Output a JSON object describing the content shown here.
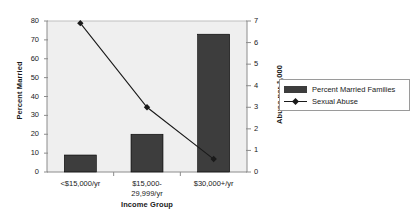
{
  "chart_data": {
    "type": "bar",
    "title": "",
    "subtitle": "",
    "xlabel": "Income Group",
    "ylabel": "Percent Married",
    "y2label": "Abuse per 1,000",
    "categories": [
      "<$15,000/yr",
      "$15,000-29,999/yr",
      "$30,000+/yr"
    ],
    "category_lines": [
      [
        "<$15,000/yr"
      ],
      [
        "$15,000-",
        "29,999/yr"
      ],
      [
        "$30,000+/yr"
      ]
    ],
    "ylim": [
      0,
      80
    ],
    "y2lim": [
      0,
      7
    ],
    "yticks": [
      0,
      10,
      20,
      30,
      40,
      50,
      60,
      70,
      80
    ],
    "y2ticks": [
      0,
      1,
      2,
      3,
      4,
      5,
      6,
      7
    ],
    "ytick_labels": [
      "0",
      "10",
      "20",
      "30",
      "40",
      "50",
      "60",
      "70",
      "80"
    ],
    "y2tick_labels": [
      "0",
      "1",
      "2",
      "3",
      "4",
      "5",
      "6",
      "7"
    ],
    "grid": false,
    "legend_position": "right",
    "series": [
      {
        "name": "Percent Married Families",
        "type": "bar",
        "axis": "left",
        "values": [
          9,
          20,
          73
        ],
        "color": "#3d3d3d"
      },
      {
        "name": "Sexual Abuse",
        "type": "line",
        "axis": "right",
        "values": [
          6.9,
          3.0,
          0.6
        ],
        "color": "#1a1a1a",
        "marker": "diamond"
      }
    ]
  },
  "legend": {
    "entries": [
      {
        "label": "Percent Married Families",
        "swatch": "bar-swatch"
      },
      {
        "label": "Sexual Abuse",
        "swatch": "line-marker-swatch"
      }
    ]
  },
  "axes": {
    "left_title": "Percent Married",
    "right_title": "Abuse per 1,000",
    "x_title": "Income Group"
  },
  "colors": {
    "plot_background": "#efefef",
    "axis_line": "#8c8c8c",
    "bar_fill": "#3d3d3d",
    "line_stroke": "#1a1a1a",
    "text": "#1a1a1a"
  }
}
